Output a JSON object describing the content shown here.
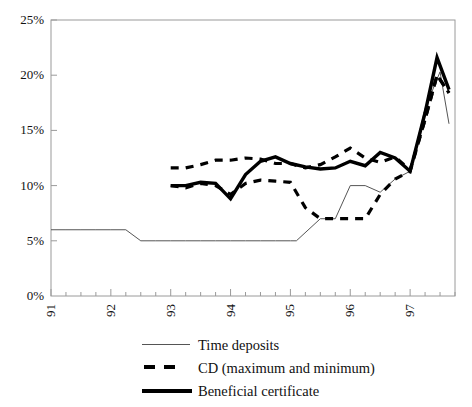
{
  "chart_data": {
    "type": "line",
    "title": "",
    "xlabel": "",
    "ylabel": "",
    "xlim": [
      91.0,
      97.75
    ],
    "ylim": [
      0,
      25
    ],
    "grid": false,
    "y_ticks": [
      0,
      5,
      10,
      15,
      20,
      25
    ],
    "y_tick_labels": [
      "0%",
      "5%",
      "10%",
      "15%",
      "20%",
      "25%"
    ],
    "x_ticks": [
      91,
      92,
      93,
      94,
      95,
      96,
      97
    ],
    "x_tick_labels": [
      "91",
      "92",
      "93",
      "94",
      "95",
      "96",
      "97"
    ],
    "x_minor_tick_step": 0.25,
    "legend_position": "below",
    "series": [
      {
        "name": "Time deposits",
        "style": "thin-solid",
        "color": "#555555",
        "width": 1,
        "points": [
          [
            91.0,
            6.0
          ],
          [
            91.25,
            6.0
          ],
          [
            91.5,
            6.0
          ],
          [
            91.75,
            6.0
          ],
          [
            92.0,
            6.0
          ],
          [
            92.25,
            6.0
          ],
          [
            92.5,
            5.0
          ],
          [
            92.75,
            5.0
          ],
          [
            93.0,
            5.0
          ],
          [
            93.25,
            5.0
          ],
          [
            93.5,
            5.0
          ],
          [
            93.75,
            5.0
          ],
          [
            94.0,
            5.0
          ],
          [
            94.25,
            5.0
          ],
          [
            94.5,
            5.0
          ],
          [
            94.75,
            5.0
          ],
          [
            95.0,
            5.0
          ],
          [
            95.1,
            5.0
          ],
          [
            95.5,
            7.0
          ],
          [
            95.75,
            7.0
          ],
          [
            96.0,
            10.0
          ],
          [
            96.25,
            10.0
          ],
          [
            96.5,
            9.4
          ],
          [
            96.75,
            10.6
          ],
          [
            97.0,
            11.3
          ],
          [
            97.25,
            17.0
          ],
          [
            97.5,
            20.3
          ],
          [
            97.65,
            15.6
          ]
        ]
      },
      {
        "name": "CD (maximum and minimum)",
        "style": "dashed",
        "color": "#000000",
        "width": 3.2,
        "branches": [
          {
            "label": "maximum",
            "points": [
              [
                93.0,
                11.6
              ],
              [
                93.25,
                11.6
              ],
              [
                93.5,
                11.9
              ],
              [
                93.75,
                12.3
              ],
              [
                94.0,
                12.3
              ],
              [
                94.25,
                12.5
              ],
              [
                94.5,
                12.4
              ],
              [
                94.75,
                12.0
              ],
              [
                95.0,
                12.0
              ],
              [
                95.25,
                11.6
              ],
              [
                95.5,
                11.9
              ],
              [
                95.75,
                12.6
              ],
              [
                96.0,
                13.4
              ],
              [
                96.25,
                12.5
              ],
              [
                96.5,
                12.1
              ],
              [
                96.75,
                12.6
              ],
              [
                97.0,
                11.4
              ],
              [
                97.25,
                16.0
              ],
              [
                97.45,
                20.0
              ],
              [
                97.65,
                18.4
              ]
            ]
          },
          {
            "label": "minimum",
            "points": [
              [
                93.0,
                10.0
              ],
              [
                93.25,
                9.8
              ],
              [
                93.5,
                10.2
              ],
              [
                93.75,
                10.0
              ],
              [
                94.0,
                9.2
              ],
              [
                94.25,
                10.2
              ],
              [
                94.5,
                10.5
              ],
              [
                94.75,
                10.4
              ],
              [
                95.0,
                10.3
              ],
              [
                95.25,
                8.0
              ],
              [
                95.5,
                7.0
              ],
              [
                95.75,
                7.0
              ],
              [
                96.0,
                7.0
              ],
              [
                96.25,
                7.0
              ],
              [
                96.5,
                9.2
              ],
              [
                96.75,
                10.6
              ],
              [
                97.0,
                11.3
              ],
              [
                97.25,
                16.0
              ],
              [
                97.45,
                20.0
              ],
              [
                97.65,
                18.4
              ]
            ]
          }
        ]
      },
      {
        "name": "Beneficial certificate",
        "style": "thick-solid",
        "color": "#000000",
        "width": 3.4,
        "points": [
          [
            93.0,
            10.0
          ],
          [
            93.25,
            10.0
          ],
          [
            93.5,
            10.3
          ],
          [
            93.75,
            10.2
          ],
          [
            94.0,
            8.8
          ],
          [
            94.25,
            11.0
          ],
          [
            94.5,
            12.2
          ],
          [
            94.75,
            12.6
          ],
          [
            95.0,
            12.0
          ],
          [
            95.25,
            11.7
          ],
          [
            95.5,
            11.5
          ],
          [
            95.75,
            11.6
          ],
          [
            96.0,
            12.2
          ],
          [
            96.25,
            11.8
          ],
          [
            96.5,
            13.0
          ],
          [
            96.75,
            12.5
          ],
          [
            97.0,
            11.3
          ],
          [
            97.25,
            16.6
          ],
          [
            97.45,
            21.6
          ],
          [
            97.65,
            18.7
          ]
        ]
      }
    ]
  },
  "legend": {
    "entries": [
      {
        "label": "Time deposits",
        "style": "thin-solid"
      },
      {
        "label": "CD (maximum and minimum)",
        "style": "dashed"
      },
      {
        "label": "Beneficial certificate",
        "style": "thick-solid"
      }
    ]
  }
}
